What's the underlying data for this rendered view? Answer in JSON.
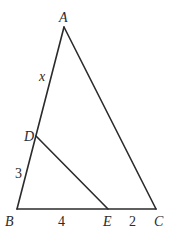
{
  "diagram": {
    "type": "triangle-with-segment",
    "points": {
      "A": {
        "label": "A",
        "x": 64,
        "y": 27
      },
      "B": {
        "label": "B",
        "x": 17,
        "y": 209
      },
      "C": {
        "label": "C",
        "x": 156,
        "y": 209
      },
      "D": {
        "label": "D",
        "x": 36,
        "y": 136
      },
      "E": {
        "label": "E",
        "x": 108,
        "y": 209
      }
    },
    "segments": [
      {
        "from": "A",
        "to": "B"
      },
      {
        "from": "A",
        "to": "C"
      },
      {
        "from": "B",
        "to": "C"
      },
      {
        "from": "D",
        "to": "E"
      }
    ],
    "measures": {
      "AD": "x",
      "DB": "3",
      "BE": "4",
      "EC": "2"
    },
    "colors": {
      "stroke": "#2b2b2b",
      "background": "#ffffff"
    }
  }
}
